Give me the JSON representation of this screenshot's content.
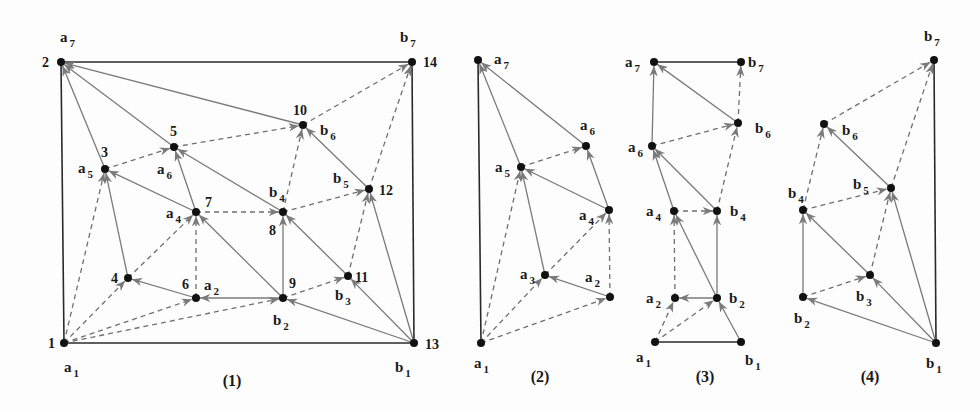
{
  "figure": {
    "colors": {
      "frame": "#2a2a2a",
      "solid_edge": "#7a7a7a",
      "dashed_edge": "#6f6f6f",
      "vertex": "#111111",
      "text": "#1a1a1a",
      "background": "#fdfdfd"
    },
    "panels": [
      {
        "id": "1",
        "caption": "(1)",
        "caption_pos": [
          232,
          386
        ],
        "vertices": [
          {
            "id": "n1",
            "x": 64,
            "y": 343,
            "num": "1",
            "num_pos": [
              48,
              348
            ],
            "label": "a",
            "sub": "1",
            "label_pos": [
              64,
              372
            ]
          },
          {
            "id": "n2",
            "x": 61,
            "y": 62,
            "num": "2",
            "num_pos": [
              42,
              67
            ],
            "label": "a",
            "sub": "7",
            "label_pos": [
              60,
              42
            ]
          },
          {
            "id": "n3",
            "x": 105,
            "y": 169,
            "num": "3",
            "num_pos": [
              101,
              157
            ],
            "label": "a",
            "sub": "5",
            "label_pos": [
              78,
              173
            ]
          },
          {
            "id": "n4",
            "x": 128,
            "y": 278,
            "num": "4",
            "num_pos": [
              111,
              283
            ],
            "label": "",
            "sub": "",
            "label_pos": [
              0,
              0
            ]
          },
          {
            "id": "n5",
            "x": 174,
            "y": 147,
            "num": "5",
            "num_pos": [
              170,
              136
            ],
            "label": "a",
            "sub": "6",
            "label_pos": [
              157,
              174
            ]
          },
          {
            "id": "n6",
            "x": 196,
            "y": 298,
            "num": "6",
            "num_pos": [
              182,
              289
            ],
            "label": "a",
            "sub": "2",
            "label_pos": [
              204,
              290
            ]
          },
          {
            "id": "n7",
            "x": 196,
            "y": 212,
            "num": "7",
            "num_pos": [
              205,
              207
            ],
            "label": "a",
            "sub": "4",
            "label_pos": [
              166,
              218
            ]
          },
          {
            "id": "n8",
            "x": 283,
            "y": 212,
            "num": "8",
            "num_pos": [
              269,
              235
            ],
            "label": "b",
            "sub": "4",
            "label_pos": [
              269,
              197
            ]
          },
          {
            "id": "n9",
            "x": 283,
            "y": 298,
            "num": "9",
            "num_pos": [
              289,
              288
            ],
            "label": "b",
            "sub": "2",
            "label_pos": [
              273,
              325
            ]
          },
          {
            "id": "n10",
            "x": 303,
            "y": 125,
            "num": "10",
            "num_pos": [
              293,
              115
            ],
            "label": "b",
            "sub": "6",
            "label_pos": [
              320,
              135
            ]
          },
          {
            "id": "n11",
            "x": 348,
            "y": 276,
            "num": "11",
            "num_pos": [
              355,
              282
            ],
            "label": "b",
            "sub": "3",
            "label_pos": [
              335,
              300
            ]
          },
          {
            "id": "n12",
            "x": 369,
            "y": 189,
            "num": "12",
            "num_pos": [
              379,
              195
            ],
            "label": "b",
            "sub": "5",
            "label_pos": [
              333,
              183
            ]
          },
          {
            "id": "n13",
            "x": 414,
            "y": 343,
            "num": "13",
            "num_pos": [
              425,
              349
            ],
            "label": "b",
            "sub": "1",
            "label_pos": [
              395,
              372
            ]
          },
          {
            "id": "n14",
            "x": 412,
            "y": 62,
            "num": "14",
            "num_pos": [
              423,
              67
            ],
            "label": "b",
            "sub": "7",
            "label_pos": [
              400,
              42
            ]
          }
        ],
        "frame_edges": [
          [
            "n1",
            "n13"
          ],
          [
            "n2",
            "n14"
          ],
          [
            "n1",
            "n2"
          ],
          [
            "n13",
            "n14"
          ]
        ],
        "solid_edges": [
          [
            "n3",
            "n2"
          ],
          [
            "n5",
            "n2"
          ],
          [
            "n10",
            "n2"
          ],
          [
            "n4",
            "n3"
          ],
          [
            "n7",
            "n3"
          ],
          [
            "n7",
            "n5"
          ],
          [
            "n8",
            "n5"
          ],
          [
            "n6",
            "n4"
          ],
          [
            "n9",
            "n6"
          ],
          [
            "n9",
            "n7"
          ],
          [
            "n9",
            "n8"
          ],
          [
            "n11",
            "n8"
          ],
          [
            "n12",
            "n10"
          ],
          [
            "n13",
            "n9"
          ],
          [
            "n13",
            "n11"
          ],
          [
            "n13",
            "n12"
          ]
        ],
        "dashed_edges": [
          [
            "n1",
            "n3"
          ],
          [
            "n1",
            "n4"
          ],
          [
            "n1",
            "n6"
          ],
          [
            "n1",
            "n9"
          ],
          [
            "n3",
            "n5"
          ],
          [
            "n5",
            "n10"
          ],
          [
            "n4",
            "n7"
          ],
          [
            "n6",
            "n7"
          ],
          [
            "n7",
            "n8"
          ],
          [
            "n8",
            "n10"
          ],
          [
            "n8",
            "n12"
          ],
          [
            "n9",
            "n11"
          ],
          [
            "n11",
            "n12"
          ],
          [
            "n10",
            "n14"
          ],
          [
            "n12",
            "n14"
          ]
        ]
      },
      {
        "id": "2",
        "caption": "(2)",
        "caption_pos": [
          540,
          382
        ],
        "vertices": [
          {
            "id": "a1",
            "x": 481,
            "y": 343,
            "num": "",
            "num_pos": [
              0,
              0
            ],
            "label": "a",
            "sub": "1",
            "label_pos": [
              474,
              368
            ]
          },
          {
            "id": "a2",
            "x": 610,
            "y": 297,
            "num": "",
            "num_pos": [
              0,
              0
            ],
            "label": "a",
            "sub": "2",
            "label_pos": [
              585,
              282
            ]
          },
          {
            "id": "a3",
            "x": 545,
            "y": 275,
            "num": "",
            "num_pos": [
              0,
              0
            ],
            "label": "a",
            "sub": "3",
            "label_pos": [
              520,
              279
            ]
          },
          {
            "id": "a4",
            "x": 609,
            "y": 210,
            "num": "",
            "num_pos": [
              0,
              0
            ],
            "label": "a",
            "sub": "4",
            "label_pos": [
              579,
              220
            ]
          },
          {
            "id": "a5",
            "x": 521,
            "y": 167,
            "num": "",
            "num_pos": [
              0,
              0
            ],
            "label": "a",
            "sub": "5",
            "label_pos": [
              495,
              172
            ]
          },
          {
            "id": "a6",
            "x": 586,
            "y": 146,
            "num": "",
            "num_pos": [
              0,
              0
            ],
            "label": "a",
            "sub": "6",
            "label_pos": [
              580,
              130
            ]
          },
          {
            "id": "a7",
            "x": 478,
            "y": 60,
            "num": "",
            "num_pos": [
              0,
              0
            ],
            "label": "a",
            "sub": "7",
            "label_pos": [
              494,
              64
            ]
          }
        ],
        "frame_edges": [
          [
            "a1",
            "a7"
          ]
        ],
        "solid_edges": [
          [
            "a2",
            "a3"
          ],
          [
            "a3",
            "a5"
          ],
          [
            "a4",
            "a5"
          ],
          [
            "a4",
            "a6"
          ],
          [
            "a5",
            "a7"
          ],
          [
            "a6",
            "a7"
          ]
        ],
        "dashed_edges": [
          [
            "a1",
            "a2"
          ],
          [
            "a1",
            "a3"
          ],
          [
            "a1",
            "a5"
          ],
          [
            "a3",
            "a4"
          ],
          [
            "a2",
            "a4"
          ],
          [
            "a5",
            "a6"
          ]
        ]
      },
      {
        "id": "3",
        "caption": "(3)",
        "caption_pos": [
          705,
          382
        ],
        "vertices": [
          {
            "id": "a1",
            "x": 655,
            "y": 342,
            "num": "",
            "num_pos": [
              0,
              0
            ],
            "label": "a",
            "sub": "1",
            "label_pos": [
              636,
              362
            ]
          },
          {
            "id": "b1",
            "x": 741,
            "y": 342,
            "num": "",
            "num_pos": [
              0,
              0
            ],
            "label": "b",
            "sub": "1",
            "label_pos": [
              745,
              365
            ]
          },
          {
            "id": "a2",
            "x": 675,
            "y": 298,
            "num": "",
            "num_pos": [
              0,
              0
            ],
            "label": "a",
            "sub": "2",
            "label_pos": [
              646,
              303
            ]
          },
          {
            "id": "b2",
            "x": 717,
            "y": 298,
            "num": "",
            "num_pos": [
              0,
              0
            ],
            "label": "b",
            "sub": "2",
            "label_pos": [
              729,
              303
            ]
          },
          {
            "id": "a4",
            "x": 674,
            "y": 211,
            "num": "",
            "num_pos": [
              0,
              0
            ],
            "label": "a",
            "sub": "4",
            "label_pos": [
              646,
              216
            ]
          },
          {
            "id": "b4",
            "x": 717,
            "y": 211,
            "num": "",
            "num_pos": [
              0,
              0
            ],
            "label": "b",
            "sub": "4",
            "label_pos": [
              730,
              216
            ]
          },
          {
            "id": "a6",
            "x": 652,
            "y": 146,
            "num": "",
            "num_pos": [
              0,
              0
            ],
            "label": "a",
            "sub": "6",
            "label_pos": [
              628,
              152
            ]
          },
          {
            "id": "b6",
            "x": 738,
            "y": 123,
            "num": "",
            "num_pos": [
              0,
              0
            ],
            "label": "b",
            "sub": "6",
            "label_pos": [
              755,
              133
            ]
          },
          {
            "id": "a7",
            "x": 654,
            "y": 62,
            "num": "",
            "num_pos": [
              0,
              0
            ],
            "label": "a",
            "sub": "7",
            "label_pos": [
              625,
              67
            ]
          },
          {
            "id": "b7",
            "x": 741,
            "y": 62,
            "num": "",
            "num_pos": [
              0,
              0
            ],
            "label": "b",
            "sub": "7",
            "label_pos": [
              748,
              67
            ]
          }
        ],
        "frame_edges": [
          [
            "a1",
            "b1"
          ],
          [
            "a7",
            "b7"
          ]
        ],
        "solid_edges": [
          [
            "b1",
            "b2"
          ],
          [
            "b2",
            "a2"
          ],
          [
            "b2",
            "a4"
          ],
          [
            "b2",
            "b4"
          ],
          [
            "a4",
            "a6"
          ],
          [
            "b4",
            "a6"
          ],
          [
            "a6",
            "a7"
          ],
          [
            "b6",
            "a7"
          ]
        ],
        "dashed_edges": [
          [
            "a1",
            "a2"
          ],
          [
            "a1",
            "b2"
          ],
          [
            "a2",
            "a4"
          ],
          [
            "a4",
            "b4"
          ],
          [
            "b4",
            "b6"
          ],
          [
            "a6",
            "b6"
          ],
          [
            "b6",
            "b7"
          ]
        ]
      },
      {
        "id": "4",
        "caption": "(4)",
        "caption_pos": [
          870,
          382
        ],
        "vertices": [
          {
            "id": "b1",
            "x": 936,
            "y": 343,
            "num": "",
            "num_pos": [
              0,
              0
            ],
            "label": "b",
            "sub": "1",
            "label_pos": [
              926,
              368
            ]
          },
          {
            "id": "b2",
            "x": 803,
            "y": 297,
            "num": "",
            "num_pos": [
              0,
              0
            ],
            "label": "b",
            "sub": "2",
            "label_pos": [
              794,
              323
            ]
          },
          {
            "id": "b3",
            "x": 870,
            "y": 275,
            "num": "",
            "num_pos": [
              0,
              0
            ],
            "label": "b",
            "sub": "3",
            "label_pos": [
              856,
              301
            ]
          },
          {
            "id": "b4",
            "x": 803,
            "y": 210,
            "num": "",
            "num_pos": [
              0,
              0
            ],
            "label": "b",
            "sub": "4",
            "label_pos": [
              788,
              198
            ]
          },
          {
            "id": "b5",
            "x": 891,
            "y": 188,
            "num": "",
            "num_pos": [
              0,
              0
            ],
            "label": "b",
            "sub": "5",
            "label_pos": [
              853,
              189
            ]
          },
          {
            "id": "b6",
            "x": 824,
            "y": 124,
            "num": "",
            "num_pos": [
              0,
              0
            ],
            "label": "b",
            "sub": "6",
            "label_pos": [
              842,
              135
            ]
          },
          {
            "id": "b7",
            "x": 934,
            "y": 60,
            "num": "",
            "num_pos": [
              0,
              0
            ],
            "label": "b",
            "sub": "7",
            "label_pos": [
              924,
              41
            ]
          }
        ],
        "frame_edges": [
          [
            "b1",
            "b7"
          ]
        ],
        "solid_edges": [
          [
            "b1",
            "b2"
          ],
          [
            "b1",
            "b3"
          ],
          [
            "b1",
            "b5"
          ],
          [
            "b2",
            "b4"
          ],
          [
            "b3",
            "b4"
          ],
          [
            "b5",
            "b6"
          ]
        ],
        "dashed_edges": [
          [
            "b2",
            "b3"
          ],
          [
            "b3",
            "b5"
          ],
          [
            "b4",
            "b5"
          ],
          [
            "b4",
            "b6"
          ],
          [
            "b5",
            "b7"
          ],
          [
            "b6",
            "b7"
          ]
        ]
      }
    ]
  }
}
